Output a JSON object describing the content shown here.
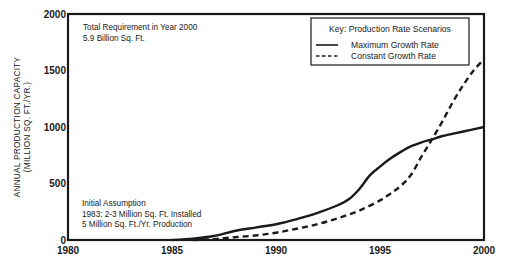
{
  "chart_data": {
    "type": "line",
    "title": "",
    "xlabel": "",
    "ylabel": "ANNUAL PRODUCTION CAPACITY (MILLION SQ. FT./YR.)",
    "ylabel_lines": [
      "ANNUAL PRODUCTION CAPACITY",
      "(MILLION SQ. FT./YR.)"
    ],
    "xlim": [
      1980,
      2000
    ],
    "ylim": [
      0,
      2000
    ],
    "x_ticks": [
      "1980",
      "1985",
      "1990",
      "1995",
      "2000"
    ],
    "y_ticks": [
      "0",
      "500",
      "1000",
      "1500",
      "2000"
    ],
    "grid": false,
    "legend": {
      "title": "Key: Production Rate Scenarios",
      "position": "upper right",
      "entries": [
        "Maximum Growth Rate",
        "Constant Growth Rate"
      ]
    },
    "series": [
      {
        "name": "Maximum Growth Rate",
        "style": "solid",
        "x": [
          1985,
          1986,
          1987,
          1988,
          1989,
          1990,
          1991,
          1992,
          1993,
          1993.5,
          1994,
          1994.5,
          1995,
          1995.5,
          1996,
          1996.5,
          1997,
          1997.5,
          1998,
          1999,
          2000
        ],
        "values": [
          0,
          12,
          35,
          80,
          110,
          140,
          185,
          240,
          310,
          360,
          450,
          570,
          650,
          720,
          780,
          830,
          865,
          890,
          920,
          960,
          1000
        ]
      },
      {
        "name": "Constant Growth Rate",
        "style": "dashed",
        "x": [
          1986,
          1987,
          1988,
          1989,
          1990,
          1991,
          1992,
          1993,
          1994,
          1995,
          1995.5,
          1996,
          1996.5,
          1997,
          1997.5,
          1998,
          1998.5,
          1999,
          1999.5,
          2000
        ],
        "values": [
          0,
          8,
          25,
          40,
          65,
          100,
          140,
          195,
          260,
          350,
          410,
          480,
          580,
          740,
          890,
          1050,
          1220,
          1370,
          1500,
          1600
        ]
      }
    ],
    "annotations": [
      {
        "lines": [
          "Total Requirement in Year 2000",
          "5.9 Billion Sq. Ft."
        ],
        "position": "upper left"
      },
      {
        "lines": [
          "Initial Assumption",
          "1983:  2-3 Million Sq. Ft. Installed",
          "5 Million Sq. Ft./Yr. Production"
        ],
        "position": "lower left"
      }
    ]
  },
  "labels": {
    "ylabel_line1": "ANNUAL PRODUCTION CAPACITY",
    "ylabel_line2": "(MILLION SQ. FT./YR.)",
    "ann_top_1": "Total Requirement in Year 2000",
    "ann_top_2": "5.9 Billion Sq. Ft.",
    "ann_bottom_1": "Initial Assumption",
    "ann_bottom_2": "1983:  2-3 Million Sq. Ft. Installed",
    "ann_bottom_3": "5 Million Sq. Ft./Yr. Production",
    "legend_title": "Key: Production Rate Scenarios",
    "legend_solid": "Maximum Growth Rate",
    "legend_dashed": "Constant Growth Rate"
  },
  "colors": {
    "ink": "#1a1a1a",
    "background": "#ffffff"
  }
}
